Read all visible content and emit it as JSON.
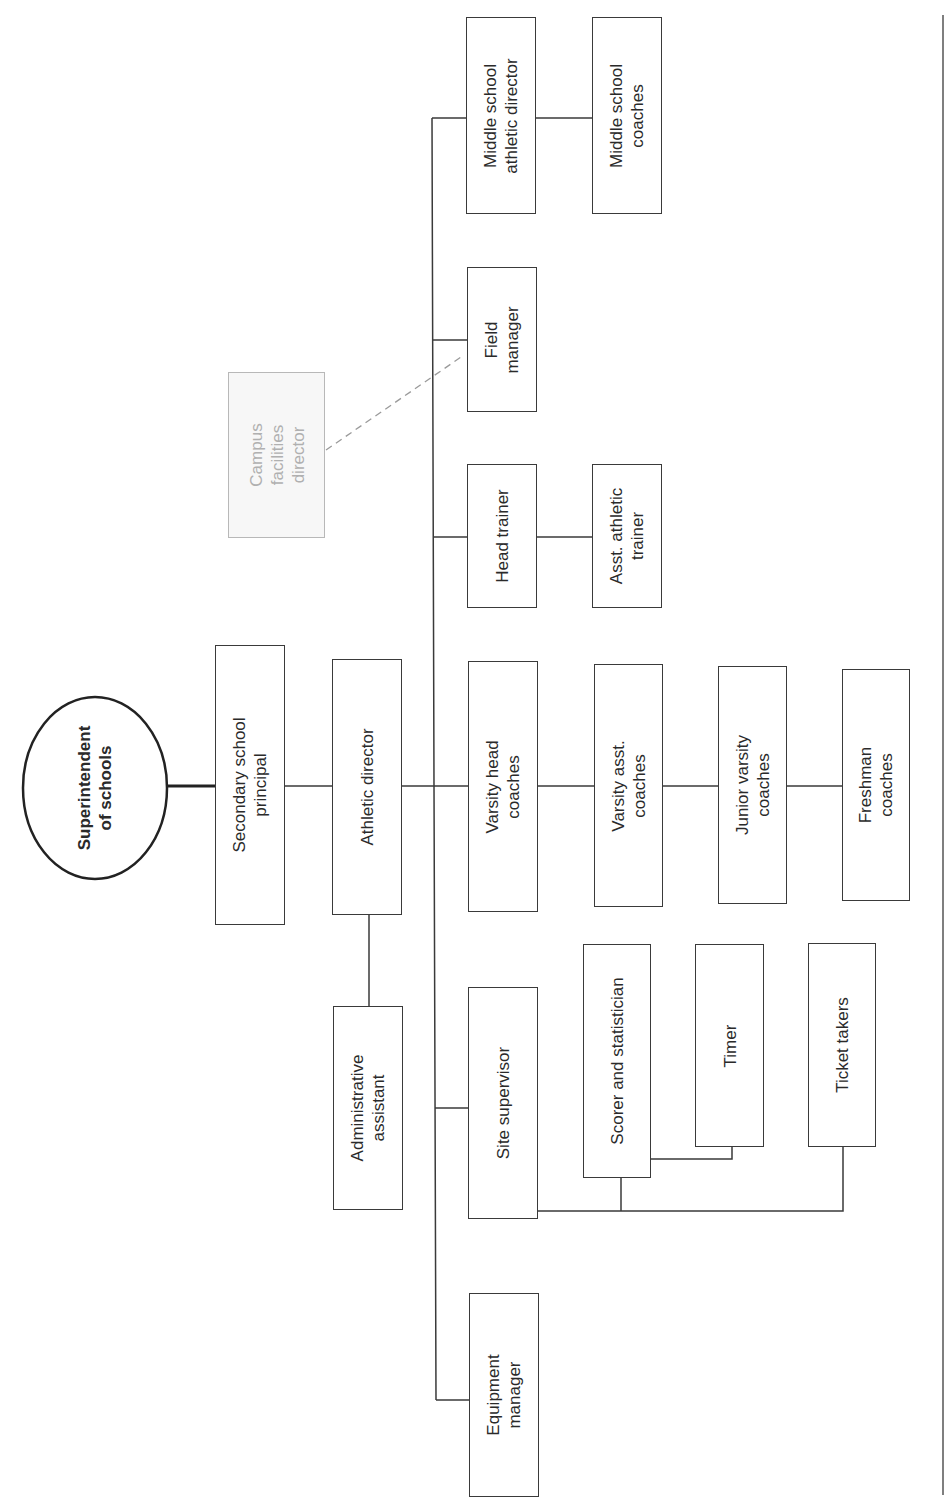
{
  "diagram": {
    "type": "org_chart",
    "orientation": "rotated-90-ccw",
    "colors": {
      "line": "#3a3a3a",
      "ghost_box": "#b8b8b8",
      "ghost_text": "#b0b0b0",
      "background": "#ffffff"
    },
    "root": {
      "line1": "Superintendent",
      "line2": "of schools"
    },
    "nodes": {
      "secondary_principal": {
        "line1": "Secondary school",
        "line2": "principal"
      },
      "athletic_director": {
        "line1": "Athletic director",
        "line2": ""
      },
      "admin_assistant": {
        "line1": "Administrative",
        "line2": "assistant"
      },
      "equipment_manager": {
        "line1": "Equipment",
        "line2": "manager"
      },
      "site_supervisor": {
        "line1": "Site supervisor",
        "line2": ""
      },
      "scorer": {
        "line1": "Scorer and statistician",
        "line2": ""
      },
      "timer": {
        "line1": "Timer",
        "line2": ""
      },
      "ticket_takers": {
        "line1": "Ticket takers",
        "line2": ""
      },
      "varsity_head": {
        "line1": "Varsity head",
        "line2": "coaches"
      },
      "varsity_asst": {
        "line1": "Varsity asst.",
        "line2": "coaches"
      },
      "jv_coaches": {
        "line1": "Junior varsity",
        "line2": "coaches"
      },
      "freshman_coaches": {
        "line1": "Freshman",
        "line2": "coaches"
      },
      "head_trainer": {
        "line1": "Head trainer",
        "line2": ""
      },
      "asst_trainer": {
        "line1": "Asst. athletic",
        "line2": "trainer"
      },
      "field_manager": {
        "line1": "Field",
        "line2": "manager"
      },
      "campus_facilities": {
        "line1": "Campus",
        "line2": "facilities",
        "line3": "director"
      },
      "ms_athletic_director": {
        "line1": "Middle school",
        "line2": "athletic director"
      },
      "ms_coaches": {
        "line1": "Middle school",
        "line2": "coaches"
      }
    },
    "edges": [
      [
        "root",
        "secondary_principal"
      ],
      [
        "secondary_principal",
        "athletic_director"
      ],
      [
        "athletic_director",
        "admin_assistant"
      ],
      [
        "athletic_director",
        "equipment_manager"
      ],
      [
        "athletic_director",
        "site_supervisor"
      ],
      [
        "site_supervisor",
        "scorer"
      ],
      [
        "site_supervisor",
        "ticket_takers"
      ],
      [
        "scorer",
        "timer"
      ],
      [
        "athletic_director",
        "varsity_head"
      ],
      [
        "varsity_head",
        "varsity_asst"
      ],
      [
        "varsity_asst",
        "jv_coaches"
      ],
      [
        "jv_coaches",
        "freshman_coaches"
      ],
      [
        "athletic_director",
        "head_trainer"
      ],
      [
        "head_trainer",
        "asst_trainer"
      ],
      [
        "athletic_director",
        "field_manager"
      ],
      [
        "athletic_director",
        "ms_athletic_director"
      ],
      [
        "ms_athletic_director",
        "ms_coaches"
      ]
    ],
    "dotted_edges": [
      [
        "campus_facilities",
        "field_manager"
      ]
    ]
  }
}
